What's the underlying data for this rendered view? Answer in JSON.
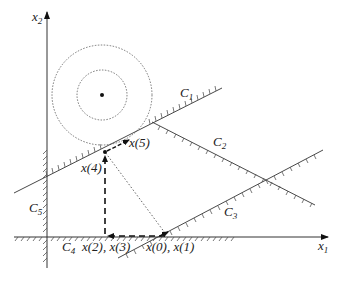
{
  "diagram": {
    "axes": {
      "x_label": "x",
      "x_sub": "1",
      "y_label": "x",
      "y_sub": "2"
    },
    "constraints": [
      {
        "name": "C",
        "sub": "1"
      },
      {
        "name": "C",
        "sub": "2"
      },
      {
        "name": "C",
        "sub": "3"
      },
      {
        "name": "C",
        "sub": "4"
      },
      {
        "name": "C",
        "sub": "5"
      }
    ],
    "points": {
      "p01": "x(0), x(1)",
      "p23": "x(2), x(3)",
      "p4": "x(4)",
      "p5": "x(5)"
    },
    "colors": {
      "line": "#333333",
      "hatch": "#555555",
      "dotted": "#555555"
    }
  }
}
